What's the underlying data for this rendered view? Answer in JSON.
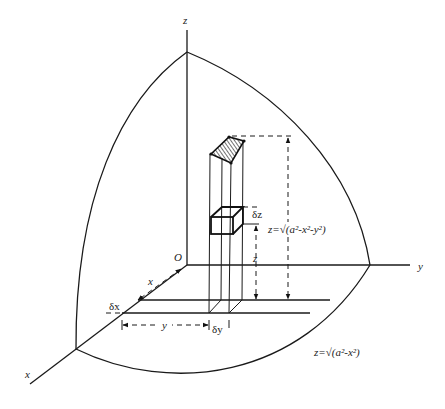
{
  "figure": {
    "axes": {
      "x_label": "x",
      "y_label": "y",
      "z_label": "z",
      "origin_label": "O"
    },
    "labels": {
      "dx": "δx",
      "dy": "δy",
      "dz": "δz",
      "x_dist": "x",
      "y_dist": "y",
      "z_height": "z",
      "surface_eq": "z=√(a²-x²-y²)",
      "surface_eq_prefix": "z=",
      "surface_eq_root": "√",
      "surface_eq_body": "(a²-x²-y²)",
      "boundary_eq": "z=√(a²-x²)",
      "boundary_eq_prefix": "z=",
      "boundary_eq_root": "√",
      "boundary_eq_body": "(a²-x²)"
    },
    "colors": {
      "line": "#1a1a1a",
      "background": "#ffffff"
    }
  }
}
